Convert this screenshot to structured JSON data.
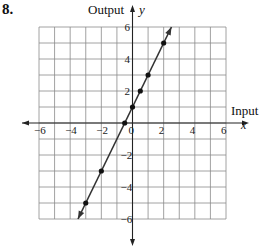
{
  "problem": {
    "number": "8."
  },
  "labels": {
    "y_word": "Output",
    "y_var": "y",
    "x_word": "Input",
    "x_var": "x"
  },
  "colors": {
    "grid": "#8a8a8a",
    "axis": "#222222",
    "line": "#333333",
    "point": "#111111"
  },
  "chart_data": {
    "type": "line",
    "title": "",
    "xlabel": "Input (x)",
    "ylabel": "Output (y)",
    "xlim": [
      -6,
      6
    ],
    "ylim": [
      -6,
      6
    ],
    "grid": true,
    "grid_step": 1,
    "x_ticks": [
      -6,
      -4,
      -2,
      0,
      2,
      4,
      6
    ],
    "x_tick_labels": [
      "−6",
      "−4",
      "−2",
      "0",
      "2",
      "4",
      "6"
    ],
    "y_ticks": [
      6,
      4,
      2,
      -2,
      -4,
      -6
    ],
    "y_tick_labels": [
      "6",
      "4",
      "2",
      "−2",
      "−4",
      "−6"
    ],
    "series": [
      {
        "name": "y = 2x + 1",
        "equation": "y = 2x + 1",
        "line_extent": {
          "x": [
            -3.5,
            2.5
          ],
          "y": [
            -6,
            6
          ]
        },
        "arrows_both_ends": true,
        "points": [
          {
            "x": -3,
            "y": -5
          },
          {
            "x": -2,
            "y": -3
          },
          {
            "x": -0.5,
            "y": 0
          },
          {
            "x": 0,
            "y": 1
          },
          {
            "x": 0.5,
            "y": 2
          },
          {
            "x": 1,
            "y": 3
          },
          {
            "x": 2,
            "y": 5
          }
        ]
      }
    ]
  }
}
